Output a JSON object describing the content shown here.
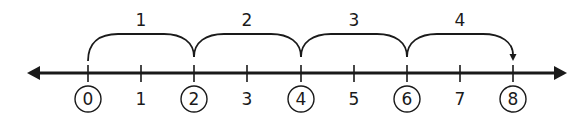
{
  "diagram": {
    "type": "number-line",
    "colors": {
      "line": "#1a1a1a",
      "background": "#ffffff"
    },
    "axis": {
      "min": 0,
      "max": 8,
      "arrows": "both",
      "ticks": [
        {
          "value": 0,
          "label": "0",
          "circled": true
        },
        {
          "value": 1,
          "label": "1",
          "circled": false
        },
        {
          "value": 2,
          "label": "2",
          "circled": true
        },
        {
          "value": 3,
          "label": "3",
          "circled": false
        },
        {
          "value": 4,
          "label": "4",
          "circled": true
        },
        {
          "value": 5,
          "label": "5",
          "circled": false
        },
        {
          "value": 6,
          "label": "6",
          "circled": true
        },
        {
          "value": 7,
          "label": "7",
          "circled": false
        },
        {
          "value": 8,
          "label": "8",
          "circled": true
        }
      ]
    },
    "jumps": [
      {
        "from": 0,
        "to": 2,
        "label": "1"
      },
      {
        "from": 2,
        "to": 4,
        "label": "2"
      },
      {
        "from": 4,
        "to": 6,
        "label": "3"
      },
      {
        "from": 6,
        "to": 8,
        "label": "4",
        "arrowhead": true
      }
    ]
  }
}
